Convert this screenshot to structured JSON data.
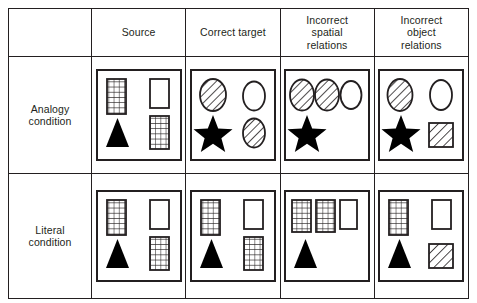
{
  "figure": {
    "title": "",
    "row_header_col_label": "",
    "columns": [
      {
        "id": "source",
        "label": "Source",
        "lines": [
          "Source"
        ]
      },
      {
        "id": "correct-target",
        "label": "Correct target",
        "lines": [
          "Correct target"
        ]
      },
      {
        "id": "incorrect-spatial-relations",
        "label": "Incorrect spatial relations",
        "lines": [
          "Incorrect",
          "spatial",
          "relations"
        ]
      },
      {
        "id": "incorrect-object-relations",
        "label": "Incorrect object relations",
        "lines": [
          "Incorrect",
          "object",
          "relations"
        ]
      }
    ],
    "rows": [
      {
        "id": "analogy",
        "label": "Analogy condition",
        "lines": [
          "Analogy",
          "condition"
        ]
      },
      {
        "id": "literal",
        "label": "Literal condition",
        "lines": [
          "Literal",
          "condition"
        ]
      }
    ],
    "colors": {
      "line": "#231f20",
      "fill_solid": "#000000",
      "background": "#ffffff"
    },
    "cells": {
      "analogy": {
        "source": {
          "shapes": [
            "grid-rectangle-tall",
            "outline-rectangle-tall",
            "grid-rectangle-tall",
            "solid-triangle"
          ]
        },
        "correct-target": {
          "shapes": [
            "hatched-ellipse",
            "outline-ellipse",
            "hatched-ellipse",
            "solid-star"
          ]
        },
        "incorrect-spatial-relations": {
          "shapes": [
            "hatched-ellipse",
            "hatched-ellipse",
            "outline-ellipse",
            "solid-star"
          ]
        },
        "incorrect-object-relations": {
          "shapes": [
            "hatched-ellipse",
            "outline-ellipse",
            "hatched-square",
            "solid-star"
          ]
        }
      },
      "literal": {
        "source": {
          "shapes": [
            "grid-rectangle-tall",
            "outline-rectangle-tall",
            "grid-rectangle-tall",
            "solid-triangle"
          ]
        },
        "correct-target": {
          "shapes": [
            "grid-rectangle-tall",
            "outline-rectangle-tall",
            "grid-rectangle-tall",
            "solid-triangle"
          ]
        },
        "incorrect-spatial-relations": {
          "shapes": [
            "grid-rectangle-tall",
            "grid-rectangle-tall",
            "outline-rectangle-tall",
            "solid-triangle"
          ]
        },
        "incorrect-object-relations": {
          "shapes": [
            "grid-rectangle-tall",
            "outline-rectangle-tall",
            "hatched-square",
            "solid-triangle"
          ]
        }
      }
    }
  }
}
